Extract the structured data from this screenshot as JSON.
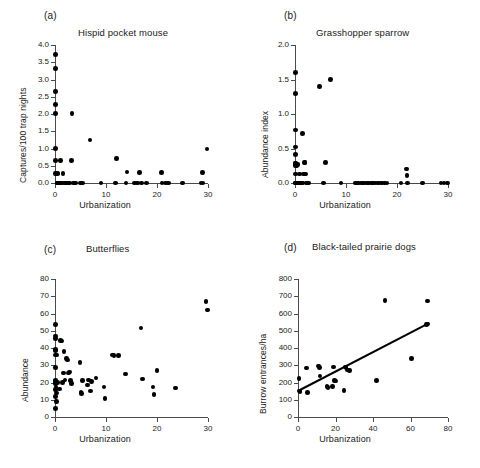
{
  "figure": {
    "background": "#ffffff",
    "marker_color": "#000000",
    "axis_color": "#4a4a4a"
  },
  "panels": [
    {
      "id": "a",
      "label": "(a)",
      "title": "Hispid pocket mouse",
      "xlabel": "Urbanization",
      "ylabel": "Captures/100 trap nights",
      "xticks": [
        "0",
        "10",
        "20",
        "30"
      ],
      "yticks": [
        "0.0",
        "0.5",
        "1.0",
        "1.5",
        "2.0",
        "2.5",
        "3.0",
        "3.5",
        "4.0"
      ]
    },
    {
      "id": "b",
      "label": "(b)",
      "title": "Grasshopper sparrow",
      "xlabel": "Urbanization",
      "ylabel": "Abundance index",
      "xticks": [
        "0",
        "10",
        "20",
        "30"
      ],
      "yticks": [
        "0.0",
        "0.5",
        "1.0",
        "1.5",
        "2.0"
      ]
    },
    {
      "id": "c",
      "label": "(c)",
      "title": "Butterflies",
      "xlabel": "Urbanization",
      "ylabel": "Abundance",
      "xticks": [
        "0",
        "10",
        "20",
        "30"
      ],
      "yticks": [
        "0",
        "10",
        "20",
        "30",
        "40",
        "50",
        "60",
        "70",
        "80"
      ]
    },
    {
      "id": "d",
      "label": "(d)",
      "title": "Black-tailed prairie dogs",
      "xlabel": "Urbanization",
      "ylabel": "Burrow entrances/ha",
      "xticks": [
        "0",
        "20",
        "40",
        "60",
        "80"
      ],
      "yticks": [
        "0",
        "100",
        "200",
        "300",
        "400",
        "500",
        "600",
        "700",
        "800"
      ]
    }
  ],
  "chart_data": [
    {
      "type": "scatter",
      "panel": "a",
      "title": "Hispid pocket mouse",
      "xlabel": "Urbanization",
      "ylabel": "Captures/100 trap nights",
      "xlim": [
        0,
        30
      ],
      "ylim": [
        0,
        4.0
      ],
      "xticks": [
        0,
        10,
        20,
        30
      ],
      "yticks": [
        0.0,
        0.5,
        1.0,
        1.5,
        2.0,
        2.5,
        3.0,
        3.5,
        4.0
      ],
      "grid": false,
      "legend": null,
      "x": [
        0.1,
        0.1,
        0.1,
        0.1,
        0.1,
        0.1,
        0.1,
        0.1,
        0.2,
        0.4,
        0.5,
        0.6,
        0.7,
        0.9,
        1.1,
        1.2,
        1.4,
        1.6,
        1.8,
        2.0,
        2.2,
        2.4,
        2.9,
        3.2,
        3.3,
        3.6,
        4.0,
        5.0,
        5.4,
        6.9,
        9.0,
        11.9,
        12.1,
        13.9,
        14.1,
        15.6,
        16.2,
        16.6,
        17.0,
        17.9,
        20.9,
        21.0,
        21.6,
        22.0,
        22.2,
        25.0,
        28.6,
        28.9,
        29.0,
        29.8
      ],
      "y": [
        3.72,
        3.32,
        2.65,
        2.27,
        2.02,
        1.0,
        0.65,
        0.28,
        0.27,
        0.0,
        0.0,
        0.28,
        0.0,
        0.0,
        0.65,
        0.0,
        0.0,
        0.28,
        0.0,
        0.0,
        0.0,
        0.0,
        0.0,
        0.65,
        2.02,
        0.0,
        0.0,
        0.0,
        0.0,
        1.25,
        0.0,
        0.0,
        0.71,
        0.0,
        0.32,
        0.0,
        0.0,
        0.31,
        0.0,
        0.0,
        0.31,
        0.0,
        0.0,
        0.0,
        0.0,
        0.0,
        0.0,
        0.31,
        0.0,
        0.99
      ]
    },
    {
      "type": "scatter",
      "panel": "b",
      "title": "Grasshopper sparrow",
      "xlabel": "Urbanization",
      "ylabel": "Abundance index",
      "xlim": [
        0,
        30
      ],
      "ylim": [
        0,
        2.0
      ],
      "xticks": [
        0,
        10,
        20,
        30
      ],
      "yticks": [
        0.0,
        0.5,
        1.0,
        1.5,
        2.0
      ],
      "grid": false,
      "legend": null,
      "x": [
        0.05,
        0.05,
        0.05,
        0.05,
        0.05,
        0.05,
        0.05,
        0.05,
        0.05,
        0.05,
        0.1,
        0.2,
        0.3,
        0.4,
        0.5,
        0.6,
        0.8,
        0.9,
        1.0,
        1.1,
        1.3,
        1.5,
        1.6,
        1.7,
        1.9,
        2.0,
        2.1,
        2.2,
        2.4,
        2.6,
        4.8,
        5.6,
        6.0,
        7.0,
        9.0,
        11.9,
        12.1,
        12.4,
        13.0,
        13.4,
        14.0,
        14.4,
        15.0,
        15.4,
        15.9,
        16.4,
        17.0,
        17.6,
        18.0,
        20.8,
        21.9,
        22.0,
        22.1,
        25.0,
        28.6,
        29.2,
        29.9
      ],
      "y": [
        1.6,
        1.3,
        0.77,
        0.52,
        0.41,
        0.28,
        0.25,
        0.13,
        0.0,
        0.0,
        0.28,
        0.0,
        0.25,
        0.0,
        0.0,
        0.27,
        0.0,
        0.13,
        0.0,
        0.0,
        0.0,
        0.72,
        0.0,
        0.13,
        0.3,
        0.3,
        0.13,
        0.0,
        0.0,
        0.0,
        1.4,
        0.0,
        0.3,
        1.5,
        0.0,
        0.0,
        0.0,
        0.0,
        0.0,
        0.0,
        0.0,
        0.0,
        0.0,
        0.0,
        0.0,
        0.0,
        0.0,
        0.0,
        0.0,
        0.0,
        0.2,
        0.11,
        0.0,
        0.0,
        0.0,
        0.0,
        0.0
      ]
    },
    {
      "type": "scatter",
      "panel": "c",
      "title": "Butterflies",
      "xlabel": "Urbanization",
      "ylabel": "Abundance",
      "xlim": [
        0,
        30
      ],
      "ylim": [
        0,
        80
      ],
      "xticks": [
        0,
        10,
        20,
        30
      ],
      "yticks": [
        0,
        10,
        20,
        30,
        40,
        50,
        60,
        70,
        80
      ],
      "grid": false,
      "legend": null,
      "x": [
        0.1,
        0.1,
        0.1,
        0.1,
        0.1,
        0.1,
        0.1,
        0.1,
        0.1,
        0.1,
        0.1,
        0.1,
        0.15,
        0.2,
        0.25,
        0.3,
        0.4,
        0.5,
        0.9,
        1.1,
        1.4,
        1.5,
        1.7,
        1.8,
        2.0,
        2.3,
        2.4,
        2.6,
        2.8,
        3.0,
        3.2,
        4.9,
        5.1,
        5.2,
        5.4,
        6.4,
        6.6,
        7.0,
        7.2,
        8.0,
        9.6,
        9.8,
        11.3,
        11.6,
        12.4,
        13.8,
        16.9,
        17.1,
        19.2,
        19.4,
        20.0,
        23.6,
        29.6,
        29.9
      ],
      "y": [
        53.5,
        47.0,
        45.5,
        39.0,
        38.5,
        36.0,
        28.8,
        21.0,
        19.5,
        16.0,
        12.0,
        5.0,
        20.5,
        17.5,
        14.0,
        9.0,
        36.0,
        20.0,
        16.2,
        44.5,
        44.0,
        20.0,
        25.5,
        38.0,
        21.5,
        34.0,
        33.0,
        25.5,
        26.0,
        21.0,
        19.5,
        31.5,
        14.5,
        13.5,
        21.0,
        18.5,
        21.5,
        15.0,
        20.5,
        22.5,
        17.3,
        10.8,
        36.0,
        35.5,
        35.5,
        25.0,
        51.5,
        22.0,
        17.5,
        13.0,
        26.8,
        16.8,
        66.8,
        62.0
      ]
    },
    {
      "type": "scatter",
      "panel": "d",
      "title": "Black-tailed prairie dogs",
      "xlabel": "Urbanization",
      "ylabel": "Burrow entrances/ha",
      "xlim": [
        0,
        80
      ],
      "ylim": [
        0,
        800
      ],
      "xticks": [
        0,
        20,
        40,
        60,
        80
      ],
      "yticks": [
        0,
        100,
        200,
        300,
        400,
        500,
        600,
        700,
        800
      ],
      "grid": false,
      "legend": null,
      "x": [
        0.5,
        0.8,
        1.0,
        4.5,
        5.0,
        11.0,
        11.5,
        11.8,
        15.5,
        16.0,
        18.5,
        19.0,
        19.5,
        20.0,
        24.5,
        25.0,
        25.5,
        26.5,
        27.5,
        42.0,
        46.5,
        60.5,
        68.5,
        69.0,
        69.2
      ],
      "y": [
        222,
        150,
        148,
        284,
        142,
        296,
        288,
        238,
        178,
        172,
        176,
        290,
        212,
        208,
        155,
        290,
        288,
        272,
        268,
        210,
        676,
        340,
        536,
        540,
        672
      ],
      "trendline": {
        "type": "linear",
        "x_start": 0,
        "y_start": 148,
        "x_end": 69.5,
        "y_end": 540
      }
    }
  ]
}
